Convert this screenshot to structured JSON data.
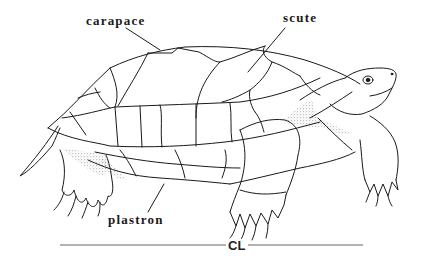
{
  "diagram": {
    "labels": {
      "carapace": "carapace",
      "scute": "scute",
      "plastron": "plastron",
      "measure": "CL"
    },
    "colors": {
      "ink": "#1a1a1a",
      "stipple": "#555555",
      "measure_line": "#666666",
      "background": "#ffffff"
    }
  }
}
